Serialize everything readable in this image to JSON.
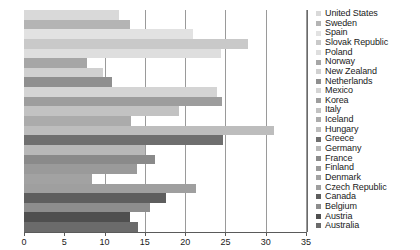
{
  "chart_data": {
    "type": "bar",
    "orientation": "horizontal",
    "title": "",
    "xlabel": "",
    "ylabel": "",
    "xlim": [
      0,
      35
    ],
    "xticks": [
      0,
      5,
      10,
      15,
      20,
      25,
      30,
      35
    ],
    "xtick_labels": [
      "0",
      "5",
      "10",
      "15",
      "20",
      "25",
      "30",
      "35"
    ],
    "grid": "vertical",
    "legend_position": "right",
    "categories": [
      "United States",
      "Sweden",
      "Spain",
      "Slovak Republic",
      "Poland",
      "Norway",
      "New Zealand",
      "Netherlands",
      "Mexico",
      "Korea",
      "Italy",
      "Iceland",
      "Hungary",
      "Greece",
      "Germany",
      "France",
      "Finland",
      "Denmark",
      "Czech Republic",
      "Canada",
      "Belgium",
      "Austria",
      "Australia"
    ],
    "values": [
      11.8,
      13.2,
      21.0,
      27.8,
      24.5,
      7.8,
      9.8,
      10.9,
      24.0,
      24.6,
      19.2,
      13.3,
      31.0,
      24.7,
      15.0,
      16.2,
      14.0,
      8.5,
      21.4,
      17.6,
      15.7,
      13.2,
      14.2
    ],
    "colors": [
      "#d9d9d9",
      "#b4b4b4",
      "#e2e2e2",
      "#c9c9c9",
      "#dedede",
      "#a6a6a6",
      "#d0d0d0",
      "#8f8f8f",
      "#d4d4d4",
      "#9d9d9d",
      "#c2c2c2",
      "#ababab",
      "#bdbdbd",
      "#6f6f6f",
      "#b8b8b8",
      "#8a8a8a",
      "#9a9a9a",
      "#a2a2a2",
      "#9f9f9f",
      "#5e5e5e",
      "#8d8d8d",
      "#4f4f4f",
      "#6b6b6b"
    ]
  }
}
